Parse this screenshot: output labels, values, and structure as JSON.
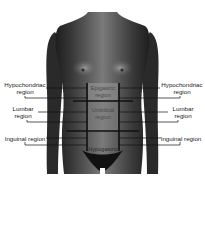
{
  "figure": {
    "colors": {
      "background": "#ffffff",
      "body": "#555555",
      "grid_lines": "#111111",
      "label_text": "#1a1a1a"
    }
  },
  "labels": {
    "left": [
      {
        "line1": "Hypochondriac",
        "line2": "region"
      },
      {
        "line1": "Lumbar",
        "line2": "region"
      },
      {
        "line1": "Inguinal region",
        "line2": ""
      }
    ],
    "right": [
      {
        "line1": "Hypochondriac",
        "line2": "region"
      },
      {
        "line1": "Lumbar",
        "line2": "region"
      },
      {
        "line1": "Inguinal region",
        "line2": ""
      }
    ],
    "center": [
      {
        "line1": "Epigastric",
        "line2": "region"
      },
      {
        "line1": "Umbilical",
        "line2": "region"
      },
      {
        "line1": "Hypogastric",
        "line2": ""
      }
    ]
  }
}
